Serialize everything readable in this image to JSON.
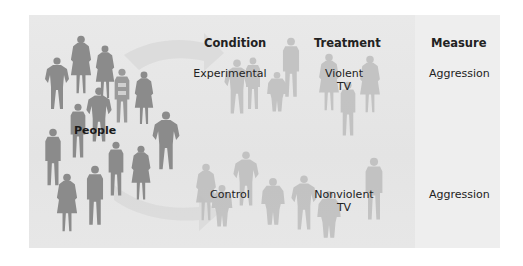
{
  "diagram": {
    "people_label": "People",
    "headers": {
      "condition": "Condition",
      "treatment": "Treatment",
      "measure": "Measure"
    },
    "rows": [
      {
        "condition": "Experimental",
        "treatment_line1": "Violent",
        "treatment_line2": "TV",
        "measure": "Aggression"
      },
      {
        "condition": "Control",
        "treatment_line1": "Nonviolent",
        "treatment_line2": "TV",
        "measure": "Aggression"
      }
    ],
    "colors": {
      "panel_bg": "#e6e6e6",
      "measure_strip": "#eeeeee",
      "people_silhouette": "#8a8a8a",
      "faded_silhouette": "#bcbcbc",
      "arrow": "#d6d6d6",
      "text": "#222222"
    }
  }
}
